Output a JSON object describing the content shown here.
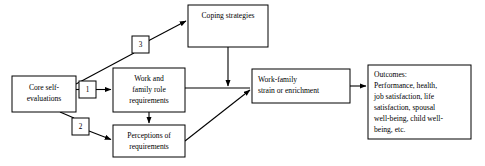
{
  "diagram": {
    "type": "flow-diagram",
    "background_color": "#ffffff",
    "line_color": "#000000",
    "nodes": [
      {
        "id": "core-self-evaluations",
        "lines": [
          "Core self-",
          "evaluations"
        ],
        "x": 12,
        "y": 76,
        "w": 64,
        "h": 36,
        "align": "center"
      },
      {
        "id": "work-family-role-requirements",
        "lines": [
          "Work and",
          "family role",
          "requirements"
        ],
        "x": 113,
        "y": 68,
        "w": 72,
        "h": 44,
        "align": "center"
      },
      {
        "id": "coping-strategies",
        "lines": [
          "Coping strategies"
        ],
        "x": 188,
        "y": 5,
        "w": 80,
        "h": 42,
        "align": "center"
      },
      {
        "id": "perceptions-of-requirements",
        "lines": [
          "Perceptions of",
          "requirements"
        ],
        "x": 113,
        "y": 125,
        "w": 72,
        "h": 32,
        "align": "center"
      },
      {
        "id": "work-family-strain-or-enrichment",
        "lines": [
          "Work-family",
          "strain or enrichment"
        ],
        "x": 252,
        "y": 69,
        "w": 98,
        "h": 34,
        "align": "left"
      },
      {
        "id": "outcomes",
        "lines": [
          "Outcomes:",
          "Performance, health,",
          "job satisfaction, life",
          "satisfaction, spousal",
          "well-being, child well-",
          "being, etc."
        ],
        "x": 368,
        "y": 65,
        "w": 103,
        "h": 74,
        "align": "left"
      }
    ],
    "path_labels": [
      {
        "id": "path-label-1",
        "label": "1",
        "x": 79,
        "y": 81,
        "w": 17,
        "h": 17
      },
      {
        "id": "path-label-2",
        "label": "2",
        "x": 72,
        "y": 118,
        "w": 17,
        "h": 17
      },
      {
        "id": "path-label-3",
        "label": "3",
        "x": 132,
        "y": 36,
        "w": 17,
        "h": 17
      }
    ],
    "edges": [
      {
        "id": "edge-core-to-work-requirements",
        "from": "core-self-evaluations",
        "to": "work-family-role-requirements",
        "label": "1"
      },
      {
        "id": "edge-core-to-perceptions",
        "from": "core-self-evaluations",
        "to": "perceptions-of-requirements",
        "label": "2"
      },
      {
        "id": "edge-core-to-coping",
        "from": "core-self-evaluations",
        "to": "coping-strategies",
        "label": "3"
      },
      {
        "id": "edge-work-requirements-to-perceptions",
        "from": "work-family-role-requirements",
        "to": "perceptions-of-requirements",
        "label": ""
      },
      {
        "id": "edge-work-requirements-to-strain",
        "from": "work-family-role-requirements",
        "to": "work-family-strain-or-enrichment",
        "label": ""
      },
      {
        "id": "edge-coping-to-strain-junction",
        "from": "coping-strategies",
        "to": "work-family-strain-or-enrichment",
        "label": ""
      },
      {
        "id": "edge-perceptions-to-strain",
        "from": "perceptions-of-requirements",
        "to": "work-family-strain-or-enrichment",
        "label": ""
      },
      {
        "id": "edge-strain-to-outcomes",
        "from": "work-family-strain-or-enrichment",
        "to": "outcomes",
        "label": ""
      }
    ]
  }
}
